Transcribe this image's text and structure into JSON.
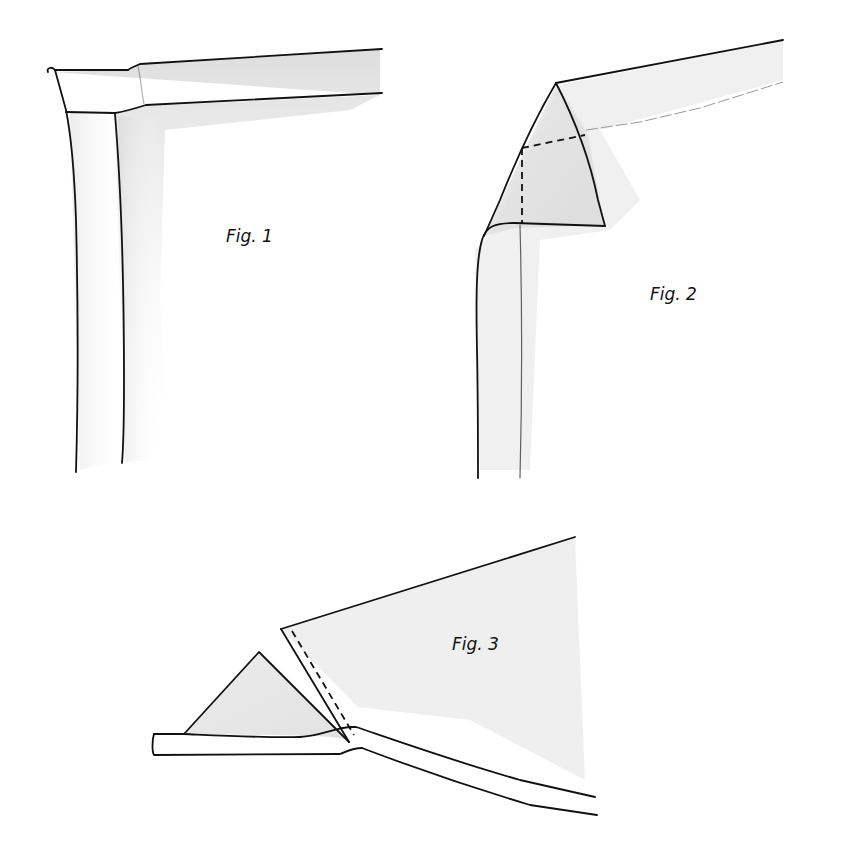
{
  "figures": [
    {
      "id": "fig1",
      "label": "Fig. 1",
      "description": "Mitred binding corner: horizontal band meeting vertical band at upper-left corner"
    },
    {
      "id": "fig2",
      "label": "Fig. 2",
      "description": "Corner folded into a triangle with dashed stitching lines"
    },
    {
      "id": "fig3",
      "label": "Fig. 3",
      "description": "Triangle fold opened with dashed stitch line along diagonal edge"
    }
  ],
  "colors": {
    "line": "#111111",
    "shading": "#d9d9d9",
    "background": "#ffffff"
  }
}
